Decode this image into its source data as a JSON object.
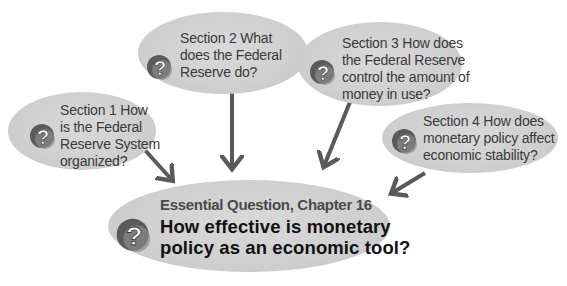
{
  "diagram": {
    "type": "concept-map",
    "colors": {
      "bubble": "#d0d0d0",
      "arrow": "#5a5a5a",
      "text": "#3a3a3a",
      "question_text": "#111111",
      "icon_dark": "#555555",
      "icon_mid": "#8a8a8a"
    },
    "sections": [
      {
        "id": "section-1",
        "lines": [
          "Section 1  How",
          "is the Federal",
          "Reserve System",
          "organized?"
        ],
        "icon": "question-mark-icon"
      },
      {
        "id": "section-2",
        "lines": [
          "Section 2  What",
          "does the Federal",
          "Reserve do?"
        ],
        "icon": "question-mark-icon"
      },
      {
        "id": "section-3",
        "lines": [
          "Section 3  How does",
          "the  Federal Reserve",
          "control the amount of",
          "money in use?"
        ],
        "icon": "question-mark-icon"
      },
      {
        "id": "section-4",
        "lines": [
          "Section 4  How does",
          "monetary policy affect",
          "economic stability?"
        ],
        "icon": "question-mark-icon"
      }
    ],
    "essential_question": {
      "title": "Essential Question, Chapter 16",
      "lines": [
        "How effective is monetary",
        "policy as an economic tool?"
      ],
      "icon": "question-mark-icon"
    },
    "edges": [
      {
        "from": "section-1",
        "to": "essential-question"
      },
      {
        "from": "section-2",
        "to": "essential-question"
      },
      {
        "from": "section-3",
        "to": "essential-question"
      },
      {
        "from": "section-4",
        "to": "essential-question"
      }
    ]
  }
}
